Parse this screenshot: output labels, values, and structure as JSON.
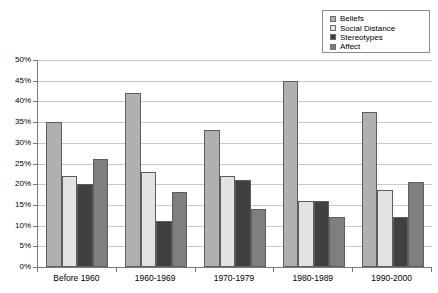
{
  "chart_data": {
    "type": "bar",
    "title": "",
    "subtitle": "",
    "xlabel": "",
    "ylabel": "",
    "ylim": [
      0,
      50
    ],
    "ytick_labels": [
      "50%",
      "45%",
      "40%",
      "35%",
      "30%",
      "25%",
      "20%",
      "15%",
      "10%",
      "5%",
      "0%"
    ],
    "ytick_values": [
      50,
      45,
      40,
      35,
      30,
      25,
      20,
      15,
      10,
      5,
      0
    ],
    "grid": true,
    "legend_position": "top-right",
    "categories": [
      "Before 1960",
      "1960-1969",
      "1970-1979",
      "1980-1989",
      "1990-2000"
    ],
    "series": [
      {
        "name": "Beliefs",
        "color": "#b0b0b0",
        "values": [
          35,
          42,
          33,
          45,
          37.5
        ]
      },
      {
        "name": "Social Distance",
        "color": "#e3e3e3",
        "values": [
          22,
          23,
          22,
          16,
          18.5
        ]
      },
      {
        "name": "Stereotypes",
        "color": "#404040",
        "values": [
          20,
          11,
          21,
          16,
          12
        ]
      },
      {
        "name": "Affect",
        "color": "#7f7f7f",
        "values": [
          26,
          18,
          14,
          12,
          20.5
        ]
      }
    ]
  },
  "legend": {
    "items": [
      {
        "label": "Beliefs",
        "swatch": "#b0b0b0"
      },
      {
        "label": "Social Distance",
        "swatch": "#e3e3e3"
      },
      {
        "label": "Stereotypes",
        "swatch": "#404040"
      },
      {
        "label": "Affect",
        "swatch": "#7f7f7f"
      }
    ]
  },
  "colors": {
    "background": "#ffffff",
    "gridline": "#c9c9c9",
    "axis": "#7a7a7a",
    "bar_border": "#5d5d5d",
    "text": "#000000"
  }
}
